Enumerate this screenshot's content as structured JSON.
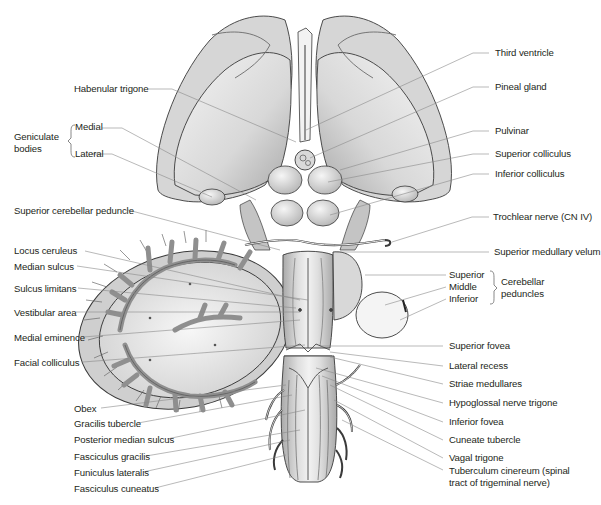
{
  "figure": {
    "colors": {
      "line": "#8a8a8a",
      "fill_light": "#e6e6e6",
      "fill_mid": "#c9c9c9",
      "fill_dark": "#9c9c9c",
      "outline": "#3a3a3a",
      "text": "#231f20"
    }
  },
  "labels_left": {
    "habenular_trigone": "Habenular trigone",
    "geniculate_group": "Geniculate bodies",
    "geniculate_group_line1": "Geniculate",
    "geniculate_group_line2": "bodies",
    "geniculate_medial": "Medial",
    "geniculate_lateral": "Lateral",
    "superior_cerebellar_peduncle": "Superior cerebellar peduncle",
    "locus_ceruleus": "Locus ceruleus",
    "median_sulcus": "Median sulcus",
    "sulcus_limitans": "Sulcus limitans",
    "vestibular_area": "Vestibular area",
    "medial_eminence": "Medial eminence",
    "facial_colliculus": "Facial colliculus",
    "obex": "Obex",
    "gracilis_tubercle": "Gracilis tubercle",
    "posterior_median_sulcus": "Posterior median sulcus",
    "fasciculus_gracilis": "Fasciculus gracilis",
    "funiculus_lateralis": "Funiculus lateralis",
    "fasciculus_cuneatus": "Fasciculus cuneatus"
  },
  "labels_right": {
    "third_ventricle": "Third ventricle",
    "pineal_gland": "Pineal gland",
    "pulvinar": "Pulvinar",
    "superior_colliculus": "Superior colliculus",
    "inferior_colliculus": "Inferior colliculus",
    "trochlear_nerve": "Trochlear nerve (CN IV)",
    "superior_medullary_velum": "Superior medullary velum",
    "peduncle_superior": "Superior",
    "peduncle_middle": "Middle",
    "peduncle_inferior": "Inferior",
    "cerebellar_peduncles_line1": "Cerebellar",
    "cerebellar_peduncles_line2": "peduncles",
    "superior_fovea": "Superior fovea",
    "lateral_recess": "Lateral recess",
    "striae_medullares": "Striae medullares",
    "hypoglossal_nerve_trigone": "Hypoglossal nerve trigone",
    "inferior_fovea": "Inferior fovea",
    "cuneate_tubercle": "Cuneate tubercle",
    "vagal_trigone": "Vagal trigone",
    "tuberculum_cinereum_line1": "Tuberculum cinereum (spinal",
    "tuberculum_cinereum_line2": "tract of trigeminal nerve)"
  }
}
